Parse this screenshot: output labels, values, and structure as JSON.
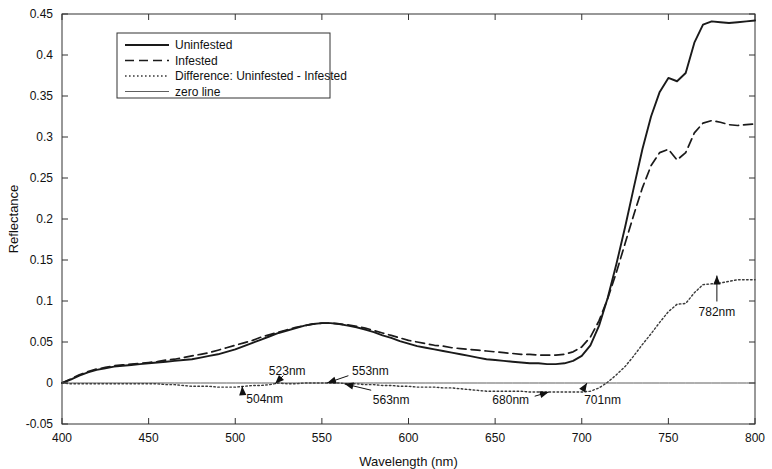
{
  "chart_data": {
    "type": "line",
    "title": "",
    "xlabel": "Wavelength (nm)",
    "ylabel": "Reflectance",
    "xlim": [
      400,
      800
    ],
    "ylim": [
      -0.05,
      0.45
    ],
    "xticks": [
      400,
      450,
      500,
      550,
      600,
      650,
      700,
      750,
      800
    ],
    "xtick_labels": [
      "400",
      "450",
      "500",
      "550",
      "600",
      "650",
      "700",
      "750",
      "800"
    ],
    "yticks": [
      -0.05,
      0,
      0.05,
      0.1,
      0.15,
      0.2,
      0.25,
      0.3,
      0.35,
      0.4,
      0.45
    ],
    "ytick_labels": [
      "-0.05",
      "0",
      "0.05",
      "0.1",
      "0.15",
      "0.2",
      "0.25",
      "0.3",
      "0.35",
      "0.4",
      "0.45"
    ],
    "grid": false,
    "legend_position": "upper left",
    "x": [
      400,
      405,
      410,
      415,
      420,
      425,
      430,
      435,
      440,
      445,
      450,
      455,
      460,
      465,
      470,
      475,
      480,
      485,
      490,
      495,
      500,
      505,
      510,
      515,
      520,
      525,
      530,
      535,
      540,
      545,
      550,
      555,
      560,
      565,
      570,
      575,
      580,
      585,
      590,
      595,
      600,
      605,
      610,
      615,
      620,
      625,
      630,
      635,
      640,
      645,
      650,
      655,
      660,
      665,
      670,
      675,
      680,
      685,
      690,
      695,
      700,
      705,
      710,
      715,
      720,
      725,
      730,
      735,
      740,
      745,
      750,
      755,
      760,
      765,
      770,
      775,
      780,
      785,
      790,
      795,
      800
    ],
    "series": [
      {
        "name": "Uninfested",
        "style": "solid",
        "color": "#1a1a1a",
        "width": 1.9,
        "values": [
          0.0,
          0.004,
          0.009,
          0.013,
          0.016,
          0.018,
          0.02,
          0.021,
          0.022,
          0.023,
          0.024,
          0.025,
          0.026,
          0.027,
          0.028,
          0.029,
          0.031,
          0.033,
          0.035,
          0.038,
          0.041,
          0.045,
          0.049,
          0.053,
          0.057,
          0.061,
          0.064,
          0.067,
          0.07,
          0.072,
          0.073,
          0.073,
          0.072,
          0.07,
          0.068,
          0.065,
          0.062,
          0.058,
          0.055,
          0.051,
          0.048,
          0.045,
          0.043,
          0.041,
          0.039,
          0.037,
          0.035,
          0.033,
          0.031,
          0.029,
          0.028,
          0.027,
          0.026,
          0.025,
          0.024,
          0.024,
          0.023,
          0.023,
          0.024,
          0.027,
          0.033,
          0.046,
          0.07,
          0.104,
          0.145,
          0.19,
          0.238,
          0.285,
          0.325,
          0.355,
          0.372,
          0.368,
          0.378,
          0.415,
          0.437,
          0.441,
          0.44,
          0.439,
          0.44,
          0.441,
          0.442
        ]
      },
      {
        "name": "Infested",
        "style": "dashed",
        "color": "#1a1a1a",
        "width": 1.7,
        "values": [
          0.0,
          0.005,
          0.01,
          0.014,
          0.017,
          0.019,
          0.021,
          0.022,
          0.023,
          0.024,
          0.025,
          0.026,
          0.028,
          0.029,
          0.031,
          0.033,
          0.035,
          0.037,
          0.04,
          0.043,
          0.046,
          0.049,
          0.052,
          0.056,
          0.059,
          0.062,
          0.065,
          0.068,
          0.07,
          0.072,
          0.073,
          0.073,
          0.072,
          0.071,
          0.069,
          0.067,
          0.064,
          0.061,
          0.058,
          0.055,
          0.052,
          0.05,
          0.048,
          0.046,
          0.045,
          0.043,
          0.042,
          0.041,
          0.04,
          0.039,
          0.038,
          0.037,
          0.036,
          0.035,
          0.035,
          0.034,
          0.034,
          0.034,
          0.035,
          0.038,
          0.044,
          0.056,
          0.076,
          0.103,
          0.135,
          0.17,
          0.205,
          0.238,
          0.265,
          0.281,
          0.285,
          0.272,
          0.281,
          0.305,
          0.317,
          0.32,
          0.318,
          0.315,
          0.314,
          0.315,
          0.316
        ]
      },
      {
        "name": "Difference: Uninfested - Infested",
        "style": "dotted",
        "color": "#3a3a3a",
        "width": 1.4,
        "values": [
          0.0,
          -0.001,
          -0.001,
          -0.001,
          -0.001,
          -0.001,
          -0.001,
          -0.001,
          -0.001,
          -0.001,
          -0.001,
          -0.001,
          -0.002,
          -0.002,
          -0.003,
          -0.004,
          -0.004,
          -0.004,
          -0.005,
          -0.005,
          -0.005,
          -0.004,
          -0.003,
          -0.003,
          -0.002,
          0.0,
          -0.001,
          -0.001,
          0.0,
          0.0,
          0.0,
          0.0,
          0.0,
          -0.001,
          -0.001,
          -0.002,
          -0.002,
          -0.003,
          -0.003,
          -0.004,
          -0.004,
          -0.005,
          -0.005,
          -0.005,
          -0.006,
          -0.006,
          -0.007,
          -0.008,
          -0.009,
          -0.01,
          -0.01,
          -0.01,
          -0.01,
          -0.01,
          -0.011,
          -0.011,
          -0.011,
          -0.011,
          -0.011,
          -0.011,
          -0.011,
          -0.01,
          -0.006,
          0.001,
          0.01,
          0.02,
          0.033,
          0.047,
          0.06,
          0.074,
          0.087,
          0.096,
          0.097,
          0.11,
          0.12,
          0.121,
          0.122,
          0.124,
          0.126,
          0.126,
          0.126
        ]
      },
      {
        "name": "zero line",
        "style": "solid-thin",
        "color": "#4d4d4d",
        "width": 0.9,
        "values": [
          0,
          0,
          0,
          0,
          0,
          0,
          0,
          0,
          0,
          0,
          0,
          0,
          0,
          0,
          0,
          0,
          0,
          0,
          0,
          0,
          0,
          0,
          0,
          0,
          0,
          0,
          0,
          0,
          0,
          0,
          0,
          0,
          0,
          0,
          0,
          0,
          0,
          0,
          0,
          0,
          0,
          0,
          0,
          0,
          0,
          0,
          0,
          0,
          0,
          0,
          0,
          0,
          0,
          0,
          0,
          0,
          0,
          0,
          0,
          0,
          0,
          0,
          0,
          0,
          0,
          0,
          0,
          0,
          0,
          0,
          0,
          0,
          0,
          0,
          0,
          0,
          0,
          0,
          0,
          0,
          0
        ]
      }
    ],
    "annotations": [
      {
        "label": "504nm",
        "x": 504,
        "y": -0.004,
        "label_x": 517,
        "label_y": -0.019,
        "arrow": "left"
      },
      {
        "label": "523nm",
        "x": 523,
        "y": -0.001,
        "label_x": 530,
        "label_y": 0.015,
        "arrow": "down"
      },
      {
        "label": "553nm",
        "x": 553,
        "y": 0.0,
        "label_x": 578,
        "label_y": 0.015,
        "arrow": "down-left"
      },
      {
        "label": "563nm",
        "x": 563,
        "y": -0.001,
        "label_x": 590,
        "label_y": -0.021,
        "arrow": "up-left"
      },
      {
        "label": "680nm",
        "x": 681,
        "y": -0.011,
        "label_x": 659,
        "label_y": -0.021,
        "arrow": "right"
      },
      {
        "label": "701nm",
        "x": 703,
        "y": 0.0,
        "label_x": 712,
        "label_y": -0.021,
        "arrow": "up-left"
      },
      {
        "label": "782nm",
        "x": 778,
        "y": 0.131,
        "label_x": 778,
        "label_y": 0.086,
        "arrow": "up"
      }
    ]
  },
  "legend": {
    "entries": [
      {
        "label": "Uninfested"
      },
      {
        "label": "Infested"
      },
      {
        "label": "Difference: Uninfested - Infested"
      },
      {
        "label": "zero line"
      }
    ]
  }
}
